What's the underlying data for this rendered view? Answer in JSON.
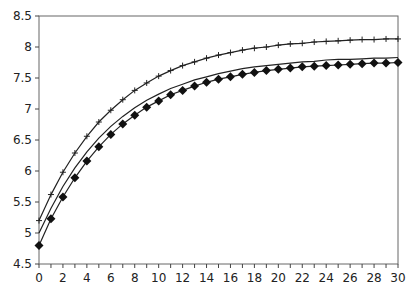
{
  "chart_data": {
    "type": "line",
    "title": "",
    "xlabel": "",
    "ylabel": "",
    "xlim": [
      0,
      30
    ],
    "ylim": [
      4.5,
      8.5
    ],
    "grid": false,
    "legend": null,
    "x_ticks": [
      "0",
      "2",
      "4",
      "6",
      "8",
      "10",
      "12",
      "14",
      "16",
      "18",
      "20",
      "22",
      "24",
      "26",
      "28",
      "30"
    ],
    "y_ticks": [
      "4.5",
      "5",
      "5.5",
      "6",
      "6.5",
      "7",
      "7.5",
      "8",
      "8.5"
    ],
    "x": [
      0,
      1,
      2,
      3,
      4,
      5,
      6,
      7,
      8,
      9,
      10,
      11,
      12,
      13,
      14,
      15,
      16,
      17,
      18,
      19,
      20,
      21,
      22,
      23,
      24,
      25,
      26,
      27,
      28,
      29,
      30
    ],
    "series": [
      {
        "name": "upper (plus markers)",
        "marker": "plus",
        "values": [
          5.2,
          5.62,
          5.98,
          6.29,
          6.56,
          6.79,
          6.98,
          7.15,
          7.3,
          7.42,
          7.53,
          7.62,
          7.7,
          7.76,
          7.82,
          7.87,
          7.91,
          7.95,
          7.98,
          8.0,
          8.03,
          8.05,
          8.06,
          8.08,
          8.09,
          8.1,
          8.11,
          8.12,
          8.12,
          8.13,
          8.13
        ]
      },
      {
        "name": "middle (no markers)",
        "marker": "none",
        "values": [
          5.0,
          5.4,
          5.75,
          6.05,
          6.31,
          6.53,
          6.72,
          6.88,
          7.02,
          7.14,
          7.24,
          7.33,
          7.4,
          7.47,
          7.52,
          7.57,
          7.61,
          7.65,
          7.68,
          7.7,
          7.72,
          7.74,
          7.76,
          7.77,
          7.79,
          7.8,
          7.8,
          7.81,
          7.82,
          7.82,
          7.83
        ]
      },
      {
        "name": "lower (diamond markers)",
        "marker": "diamond",
        "values": [
          4.8,
          5.23,
          5.58,
          5.89,
          6.16,
          6.39,
          6.59,
          6.76,
          6.9,
          7.03,
          7.13,
          7.23,
          7.3,
          7.37,
          7.43,
          7.48,
          7.52,
          7.56,
          7.59,
          7.62,
          7.64,
          7.66,
          7.68,
          7.69,
          7.7,
          7.71,
          7.72,
          7.73,
          7.74,
          7.74,
          7.75
        ]
      }
    ]
  }
}
